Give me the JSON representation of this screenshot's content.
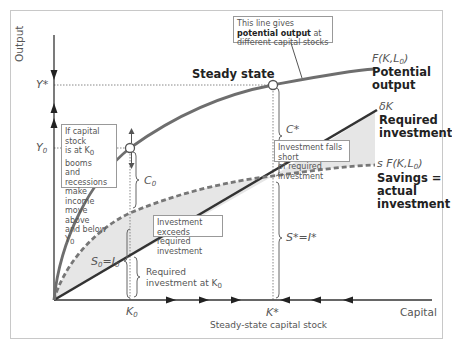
{
  "diagram": {
    "type": "solow-growth-model",
    "y_axis_label": "Output",
    "x_axis_label": "Capital",
    "x_axis_sublabel": "Steady-state capital stock",
    "ticks": {
      "y_star": "Y*",
      "y_zero": "Y",
      "y_zero_sub": "0",
      "k_zero": "K",
      "k_zero_sub": "0",
      "k_star": "K*"
    },
    "steady_state_label": "Steady state",
    "curves": {
      "production": {
        "formula_main": "F(K,L",
        "formula_sub": "0",
        "formula_end": ")",
        "name_line1": "Potential",
        "name_line2": "output",
        "color": "#6b6b6b"
      },
      "depreciation": {
        "formula": "δK",
        "name_line1": "Required",
        "name_line2": "investment",
        "color": "#333333"
      },
      "savings": {
        "formula_main": "s F(K,L",
        "formula_sub": "0",
        "formula_end": ")",
        "name_line1": "Savings =",
        "name_line2": "actual",
        "name_line3": "investment",
        "color": "#6b6b6b"
      }
    },
    "brace_labels": {
      "c_star": "C*",
      "s_star": "S*=I*",
      "c_zero": "C",
      "c_zero_sub": "0",
      "s_zero": "S",
      "s_zero_sub": "0",
      "s_zero_eq": "=I",
      "i_zero_sub": "0",
      "required_at_k0_line1": "Required",
      "required_at_k0_line2": "investment at K",
      "required_at_k0_sub": "0"
    },
    "callouts": {
      "potential_output_pre": "This line gives ",
      "potential_output_bold": "potential output",
      "potential_output_post": " at different capital stocks",
      "booms_line1": "If capital stock",
      "booms_line2": "is at K",
      "booms_line2_sub": "0",
      "booms_line2_end": " booms",
      "booms_line3": "and recessions",
      "booms_line4": "make income",
      "booms_line5": "move above",
      "booms_line6": "and below Y",
      "booms_line6_sub": "0",
      "exceeds_line1": "Investment exceeds",
      "exceeds_line2": "required investment",
      "falls_short_line1": "Investment falls short",
      "falls_short_line2": "of required investment"
    },
    "colors": {
      "frame": "#c8c8c8",
      "shade": "#e8e8e8",
      "axis": "#333333"
    }
  }
}
